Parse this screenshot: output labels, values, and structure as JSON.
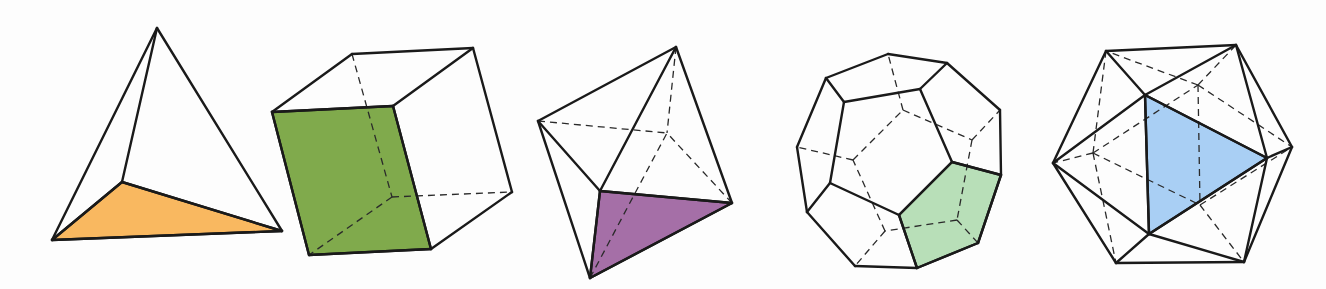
{
  "figure": {
    "solids": [
      {
        "name": "tetrahedron",
        "highlight_color": "#f9b860",
        "vertices": {
          "apex": [
            157,
            28
          ],
          "bl": [
            52,
            240
          ],
          "br": [
            282,
            231
          ],
          "inner": [
            122,
            182
          ]
        },
        "face": [
          "bl",
          "inner",
          "br"
        ],
        "edges": [
          [
            "apex",
            "bl"
          ],
          [
            "apex",
            "br"
          ],
          [
            "apex",
            "inner"
          ],
          [
            "bl",
            "br"
          ],
          [
            "bl",
            "inner"
          ],
          [
            "inner",
            "br"
          ]
        ],
        "hidden_edges": []
      },
      {
        "name": "cube",
        "highlight_color": "#80aa4c",
        "vertices": {
          "ftl": [
            272,
            112
          ],
          "ftr": [
            393,
            106
          ],
          "fbr": [
            431,
            249
          ],
          "fbl": [
            309,
            255
          ],
          "btl": [
            352,
            54
          ],
          "btr": [
            473,
            48
          ],
          "bbr": [
            512,
            192
          ],
          "bbl": [
            392,
            197
          ]
        },
        "face": [
          "ftl",
          "ftr",
          "fbr",
          "fbl"
        ],
        "edges": [
          [
            "ftl",
            "ftr"
          ],
          [
            "ftr",
            "fbr"
          ],
          [
            "fbr",
            "fbl"
          ],
          [
            "fbl",
            "ftl"
          ],
          [
            "ftl",
            "btl"
          ],
          [
            "btl",
            "btr"
          ],
          [
            "btr",
            "ftr"
          ],
          [
            "btr",
            "bbr"
          ],
          [
            "bbr",
            "fbr"
          ]
        ],
        "hidden_edges": [
          [
            "btl",
            "bbl"
          ],
          [
            "bbl",
            "bbr"
          ],
          [
            "bbl",
            "fbl"
          ]
        ]
      },
      {
        "name": "octahedron",
        "highlight_color": "#a56fa7",
        "vertices": {
          "top": [
            676,
            47
          ],
          "left": [
            538,
            121
          ],
          "front": [
            600,
            191
          ],
          "right": [
            732,
            203
          ],
          "bottom": [
            590,
            278
          ],
          "back": [
            667,
            133
          ]
        },
        "face": [
          "front",
          "right",
          "bottom"
        ],
        "edges": [
          [
            "top",
            "left"
          ],
          [
            "top",
            "front"
          ],
          [
            "top",
            "right"
          ],
          [
            "left",
            "front"
          ],
          [
            "left",
            "bottom"
          ],
          [
            "front",
            "right"
          ],
          [
            "front",
            "bottom"
          ],
          [
            "right",
            "bottom"
          ]
        ],
        "hidden_edges": [
          [
            "top",
            "back"
          ],
          [
            "left",
            "back"
          ],
          [
            "right",
            "back"
          ],
          [
            "bottom",
            "back"
          ]
        ]
      },
      {
        "name": "dodecahedron",
        "highlight_color": "#b8dfb8",
        "vertices": {
          "o1": [
            888,
            54
          ],
          "o2": [
            947,
            63
          ],
          "o3": [
            1000,
            110
          ],
          "o4": [
            1001,
            175
          ],
          "o5": [
            978,
            243
          ],
          "o6": [
            917,
            268
          ],
          "o7": [
            855,
            266
          ],
          "o8": [
            807,
            212
          ],
          "o9": [
            797,
            147
          ],
          "o10": [
            826,
            78
          ],
          "f1": [
            844,
            102
          ],
          "f2": [
            920,
            89
          ],
          "f3": [
            952,
            162
          ],
          "f4": [
            899,
            215
          ],
          "f5": [
            830,
            183
          ],
          "b1": [
            903,
            110
          ],
          "b2": [
            972,
            140
          ],
          "b3": [
            957,
            220
          ],
          "b4": [
            885,
            231
          ],
          "b5": [
            853,
            160
          ]
        },
        "face": [
          "f3",
          "o4",
          "o5",
          "o6",
          "f4"
        ],
        "edges": [
          [
            "o1",
            "o2"
          ],
          [
            "o2",
            "o3"
          ],
          [
            "o3",
            "o4"
          ],
          [
            "o4",
            "o5"
          ],
          [
            "o5",
            "o6"
          ],
          [
            "o6",
            "o7"
          ],
          [
            "o7",
            "o8"
          ],
          [
            "o8",
            "o9"
          ],
          [
            "o9",
            "o10"
          ],
          [
            "o10",
            "o1"
          ],
          [
            "f1",
            "f2"
          ],
          [
            "f2",
            "f3"
          ],
          [
            "f3",
            "f4"
          ],
          [
            "f4",
            "f5"
          ],
          [
            "f5",
            "f1"
          ],
          [
            "o10",
            "f1"
          ],
          [
            "o2",
            "f2"
          ],
          [
            "o4",
            "f3"
          ],
          [
            "o6",
            "f4"
          ],
          [
            "o8",
            "f5"
          ]
        ],
        "hidden_edges": [
          [
            "b1",
            "b2"
          ],
          [
            "b2",
            "b3"
          ],
          [
            "b3",
            "b4"
          ],
          [
            "b4",
            "b5"
          ],
          [
            "b5",
            "b1"
          ],
          [
            "b1",
            "o1"
          ],
          [
            "b2",
            "o3"
          ],
          [
            "b3",
            "o5"
          ],
          [
            "b4",
            "o7"
          ],
          [
            "b5",
            "o9"
          ]
        ]
      },
      {
        "name": "icosahedron",
        "highlight_color": "#a9cff4",
        "vertices": {
          "h1": [
            1106,
            51
          ],
          "h2": [
            1236,
            45
          ],
          "h3": [
            1292,
            147
          ],
          "h4": [
            1244,
            262
          ],
          "h5": [
            1116,
            263
          ],
          "h6": [
            1053,
            163
          ],
          "a": [
            1145,
            95
          ],
          "b": [
            1267,
            158
          ],
          "c": [
            1149,
            234
          ],
          "d": [
            1093,
            153
          ],
          "e": [
            1198,
            85
          ],
          "g": [
            1200,
            205
          ]
        },
        "face": [
          "a",
          "b",
          "c"
        ],
        "edges": [
          [
            "h1",
            "h2"
          ],
          [
            "h2",
            "h3"
          ],
          [
            "h3",
            "h4"
          ],
          [
            "h4",
            "h5"
          ],
          [
            "h5",
            "h6"
          ],
          [
            "h6",
            "h1"
          ],
          [
            "a",
            "h1"
          ],
          [
            "a",
            "h2"
          ],
          [
            "a",
            "h6"
          ],
          [
            "a",
            "b"
          ],
          [
            "a",
            "c"
          ],
          [
            "b",
            "c"
          ],
          [
            "b",
            "h2"
          ],
          [
            "b",
            "h3"
          ],
          [
            "b",
            "h4"
          ],
          [
            "c",
            "h4"
          ],
          [
            "c",
            "h5"
          ],
          [
            "c",
            "h6"
          ]
        ],
        "hidden_edges": [
          [
            "d",
            "h1"
          ],
          [
            "d",
            "h5"
          ],
          [
            "d",
            "h6"
          ],
          [
            "d",
            "e"
          ],
          [
            "d",
            "g"
          ],
          [
            "e",
            "h1"
          ],
          [
            "e",
            "h2"
          ],
          [
            "e",
            "h3"
          ],
          [
            "e",
            "g"
          ],
          [
            "g",
            "h3"
          ],
          [
            "g",
            "h4"
          ]
        ]
      }
    ]
  }
}
